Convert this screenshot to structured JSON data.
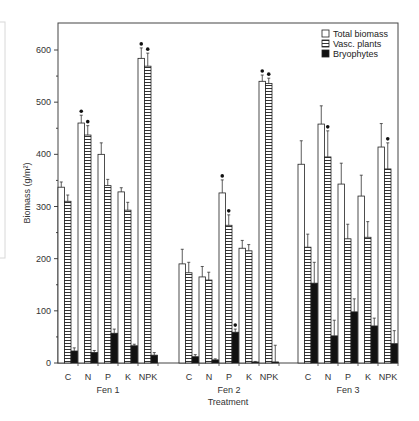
{
  "chart_data": {
    "type": "bar",
    "title": "",
    "xlabel": "Treatment",
    "ylabel": "Biomass (g/m²)",
    "ylim": [
      0,
      650
    ],
    "yticks": [
      0,
      100,
      200,
      300,
      400,
      500,
      600
    ],
    "grid": false,
    "legend_position": "upper right",
    "groups": [
      "Fen 1",
      "Fen 2",
      "Fen 3"
    ],
    "categories": [
      "C",
      "N",
      "P",
      "K",
      "NPK"
    ],
    "series": [
      {
        "name": "Total biomass",
        "pattern": "open",
        "values": {
          "Fen 1": [
            337,
            460,
            400,
            328,
            584
          ],
          "Fen 2": [
            190,
            165,
            326,
            220,
            540
          ],
          "Fen 3": [
            381,
            458,
            343,
            320,
            414
          ]
        },
        "errors": {
          "Fen 1": [
            10,
            15,
            22,
            8,
            20
          ],
          "Fen 2": [
            28,
            20,
            25,
            15,
            12
          ],
          "Fen 3": [
            45,
            35,
            40,
            40,
            45
          ]
        },
        "significant": {
          "Fen 1": [
            false,
            true,
            false,
            false,
            true
          ],
          "Fen 2": [
            false,
            false,
            true,
            false,
            true
          ],
          "Fen 3": [
            false,
            false,
            false,
            false,
            false
          ]
        }
      },
      {
        "name": "Vasc. plants",
        "pattern": "horizontal-hatch",
        "values": {
          "Fen 1": [
            310,
            437,
            340,
            293,
            569
          ],
          "Fen 2": [
            173,
            159,
            264,
            215,
            536
          ],
          "Fen 3": [
            222,
            395,
            238,
            241,
            372
          ]
        },
        "errors": {
          "Fen 1": [
            12,
            18,
            12,
            15,
            25
          ],
          "Fen 2": [
            20,
            15,
            20,
            12,
            10
          ],
          "Fen 3": [
            25,
            50,
            28,
            30,
            50
          ]
        },
        "significant": {
          "Fen 1": [
            false,
            true,
            false,
            false,
            true
          ],
          "Fen 2": [
            false,
            false,
            true,
            false,
            true
          ],
          "Fen 3": [
            false,
            true,
            false,
            false,
            true
          ]
        }
      },
      {
        "name": "Bryophytes",
        "pattern": "solid",
        "values": {
          "Fen 1": [
            23,
            20,
            57,
            33,
            15
          ],
          "Fen 2": [
            12,
            6,
            59,
            2,
            2
          ],
          "Fen 3": [
            153,
            52,
            98,
            71,
            37
          ]
        },
        "errors": {
          "Fen 1": [
            6,
            4,
            8,
            3,
            5
          ],
          "Fen 2": [
            4,
            2,
            6,
            1,
            32
          ],
          "Fen 3": [
            40,
            30,
            25,
            15,
            25
          ]
        },
        "significant": {
          "Fen 1": [
            false,
            false,
            false,
            false,
            false
          ],
          "Fen 2": [
            false,
            false,
            true,
            false,
            false
          ],
          "Fen 3": [
            false,
            false,
            false,
            false,
            false
          ]
        }
      }
    ],
    "legend": [
      "Total biomass",
      "Vasc. plants",
      "Bryophytes"
    ]
  },
  "colors": {
    "axis": "#333333",
    "bar_outline": "#222222",
    "solid": "#111111",
    "hatch": "#333333",
    "open_fill": "#ffffff"
  }
}
